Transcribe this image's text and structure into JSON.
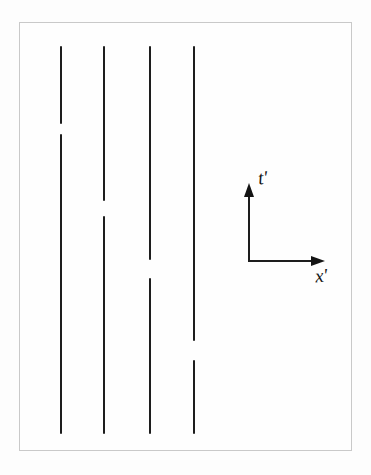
{
  "figure": {
    "colors": {
      "background": "#fdfdfd",
      "frame_border": "#c9c9c9",
      "line_color": "#1d1d1d",
      "label_color": "#141414"
    },
    "axes": {
      "t_label": "t′",
      "x_label": "x′",
      "origin": {
        "x": 249,
        "y": 261
      },
      "t_arrow_tip_y": 184,
      "x_arrow_tip_x": 325
    },
    "worldlines": [
      {
        "x": 61,
        "top": 46,
        "bottom": 434,
        "gap_top": 124,
        "gap_bottom": 134
      },
      {
        "x": 104,
        "top": 46,
        "bottom": 434,
        "gap_top": 201,
        "gap_bottom": 216
      },
      {
        "x": 150,
        "top": 46,
        "bottom": 434,
        "gap_top": 260,
        "gap_bottom": 278
      },
      {
        "x": 194,
        "top": 46,
        "bottom": 434,
        "gap_top": 341,
        "gap_bottom": 360
      }
    ]
  }
}
